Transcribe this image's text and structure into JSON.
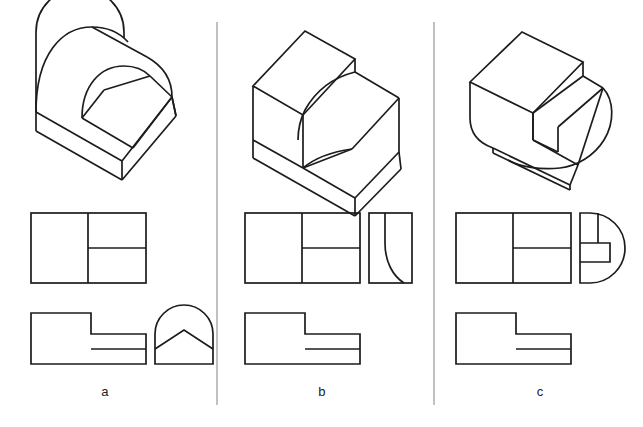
{
  "figure": {
    "background_color": "#ffffff",
    "line_color": "#1c1c1c",
    "divider_color": "#8d8d8d",
    "canvas": {
      "width": 643,
      "height": 427
    }
  },
  "columns": [
    {
      "id": "a",
      "label": "a",
      "label_x": 105,
      "isometric": {
        "name": "isometric-a",
        "description": "Rectangular block with half-cylindrical arched back face and an inclined ramp surface cut through it"
      },
      "views": [
        {
          "name": "top-view-a",
          "type": "rectangle-split",
          "description": "Rectangle divided by a vertical line, right half split by a horizontal line"
        },
        {
          "name": "front-view-a",
          "type": "stepped-L",
          "description": "L-shaped stepped outline with a horizontal line across the lower right step"
        },
        {
          "name": "side-view-a",
          "type": "arch-with-peak",
          "description": "Semicircular arch over a rectangle base with an inverted-V peak line inside"
        }
      ]
    },
    {
      "id": "b",
      "label": "b",
      "label_x": 322,
      "isometric": {
        "name": "isometric-b",
        "description": "Stepped rectangular block with a concave S-curved fillet transition on the lower step"
      },
      "views": [
        {
          "name": "top-view-b",
          "type": "rectangle-split",
          "description": "Rectangle divided by a vertical line, right half split by a horizontal line"
        },
        {
          "name": "front-view-b",
          "type": "stepped-L",
          "description": "L-shaped stepped outline with a horizontal line across the lower right step"
        },
        {
          "name": "side-view-b",
          "type": "rectangle-with-s-curve",
          "description": "Rectangle containing a vertical line that turns into a quarter-round curve toward the lower right"
        }
      ]
    },
    {
      "id": "c",
      "label": "c",
      "label_x": 540,
      "isometric": {
        "name": "isometric-c",
        "description": "Stepped rectangular block with a rounded cylindrical bottom end"
      },
      "views": [
        {
          "name": "top-view-c",
          "type": "rectangle-split",
          "description": "Rectangle divided by a vertical line, right half split by a horizontal line"
        },
        {
          "name": "front-view-c",
          "type": "stepped-L",
          "description": "L-shaped stepped outline with a horizontal line across the lower right step"
        },
        {
          "name": "side-view-c",
          "type": "d-shape-with-notch",
          "description": "D-shaped outline, flat on the left and semicircular on the right, with a stepped notch inside"
        }
      ]
    }
  ],
  "dividers": [
    {
      "name": "column-divider-1",
      "x": 217,
      "y1": 22,
      "y2": 405
    },
    {
      "name": "column-divider-2",
      "x": 434,
      "y1": 22,
      "y2": 405
    }
  ]
}
